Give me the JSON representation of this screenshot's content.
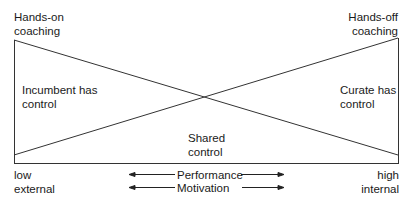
{
  "corners": {
    "top_left": [
      "Hands-on",
      "coaching"
    ],
    "top_right": [
      "Hands-off",
      "coaching"
    ]
  },
  "regions": {
    "left": [
      "Incumbent has",
      "control"
    ],
    "right": [
      "Curate has",
      "control"
    ],
    "bottom": [
      "Shared",
      "control"
    ]
  },
  "axis": {
    "left": [
      "low",
      "external"
    ],
    "right": [
      "high",
      "internal"
    ],
    "center": [
      "Performance",
      "Motivation"
    ]
  },
  "colors": {
    "line": "#333333",
    "text": "#1a1a1a"
  }
}
